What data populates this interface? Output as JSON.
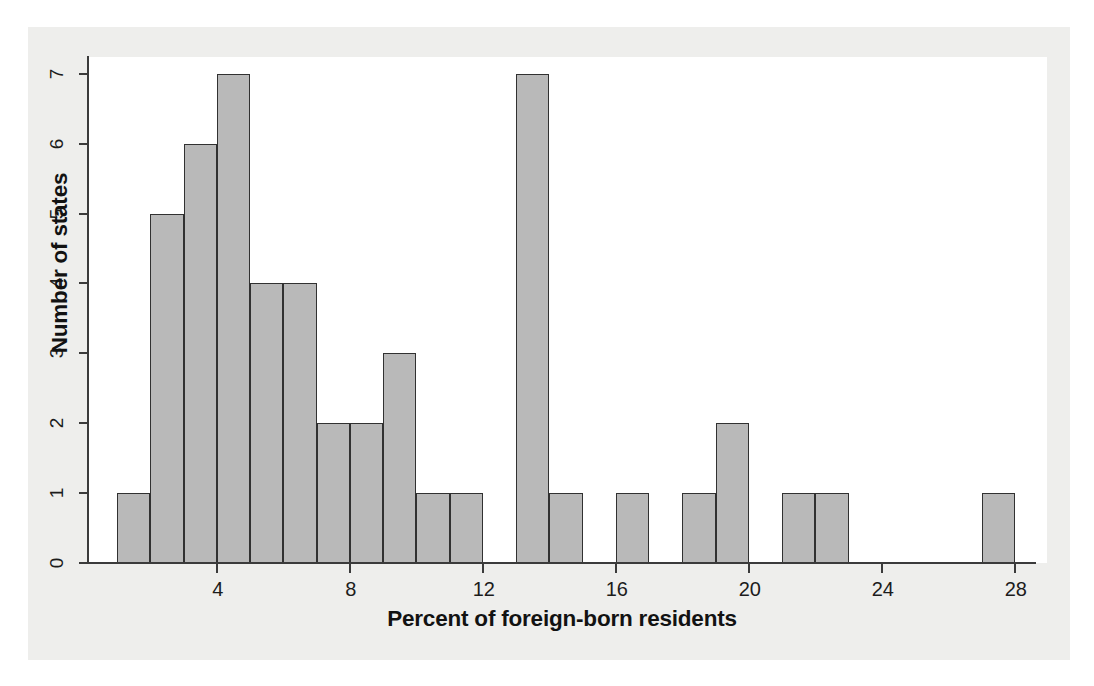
{
  "figure": {
    "background_color": "#eeeeec",
    "plot_background_color": "#ffffff",
    "bar_fill_color": "#b9b9b9",
    "bar_edge_color": "#313131",
    "axis_color": "#3b3b3b"
  },
  "chart_data": {
    "type": "bar",
    "title": "",
    "subtitle": "",
    "xlabel": "Percent of foreign-born residents",
    "ylabel": "Number of states",
    "xlim": [
      1,
      28
    ],
    "ylim": [
      0,
      7
    ],
    "bin_width": 1,
    "grid": false,
    "legend": null,
    "xticks": [
      4,
      8,
      12,
      16,
      20,
      24,
      28
    ],
    "xtick_labels": [
      "4",
      "8",
      "12",
      "16",
      "20",
      "24",
      "28"
    ],
    "yticks": [
      0,
      1,
      2,
      3,
      4,
      5,
      6,
      7
    ],
    "ytick_labels": [
      "0",
      "1",
      "2",
      "3",
      "4",
      "5",
      "6",
      "7"
    ],
    "bins": [
      {
        "start": 1,
        "end": 2,
        "count": 1
      },
      {
        "start": 2,
        "end": 3,
        "count": 5
      },
      {
        "start": 3,
        "end": 4,
        "count": 6
      },
      {
        "start": 4,
        "end": 5,
        "count": 7
      },
      {
        "start": 5,
        "end": 6,
        "count": 4
      },
      {
        "start": 6,
        "end": 7,
        "count": 4
      },
      {
        "start": 7,
        "end": 8,
        "count": 2
      },
      {
        "start": 8,
        "end": 9,
        "count": 2
      },
      {
        "start": 9,
        "end": 10,
        "count": 3
      },
      {
        "start": 10,
        "end": 11,
        "count": 1
      },
      {
        "start": 11,
        "end": 12,
        "count": 1
      },
      {
        "start": 12,
        "end": 13,
        "count": 0
      },
      {
        "start": 13,
        "end": 14,
        "count": 7
      },
      {
        "start": 14,
        "end": 15,
        "count": 1
      },
      {
        "start": 15,
        "end": 16,
        "count": 0
      },
      {
        "start": 16,
        "end": 17,
        "count": 1
      },
      {
        "start": 17,
        "end": 18,
        "count": 0
      },
      {
        "start": 18,
        "end": 19,
        "count": 1
      },
      {
        "start": 19,
        "end": 20,
        "count": 2
      },
      {
        "start": 20,
        "end": 21,
        "count": 0
      },
      {
        "start": 21,
        "end": 22,
        "count": 1
      },
      {
        "start": 22,
        "end": 23,
        "count": 1
      },
      {
        "start": 23,
        "end": 24,
        "count": 0
      },
      {
        "start": 24,
        "end": 25,
        "count": 0
      },
      {
        "start": 25,
        "end": 26,
        "count": 0
      },
      {
        "start": 26,
        "end": 27,
        "count": 0
      },
      {
        "start": 27,
        "end": 28,
        "count": 1
      }
    ],
    "categories": [
      "1-2",
      "2-3",
      "3-4",
      "4-5",
      "5-6",
      "6-7",
      "7-8",
      "8-9",
      "9-10",
      "10-11",
      "11-12",
      "12-13",
      "13-14",
      "14-15",
      "15-16",
      "16-17",
      "17-18",
      "18-19",
      "19-20",
      "20-21",
      "21-22",
      "22-23",
      "23-24",
      "24-25",
      "25-26",
      "26-27",
      "27-28"
    ],
    "values": [
      1,
      5,
      6,
      7,
      4,
      4,
      2,
      2,
      3,
      1,
      1,
      0,
      7,
      1,
      0,
      1,
      0,
      1,
      2,
      0,
      1,
      1,
      0,
      0,
      0,
      0,
      1
    ]
  }
}
